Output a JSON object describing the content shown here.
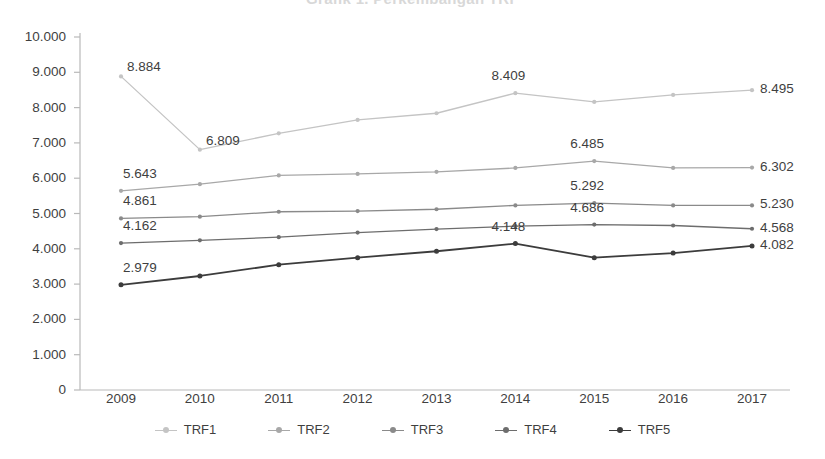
{
  "title_remnant": "Grafik 1. Perkembangan TRF",
  "axis": {
    "y_ticks": [
      "10.000",
      "9.000",
      "8.000",
      "7.000",
      "6.000",
      "5.000",
      "4.000",
      "3.000",
      "2.000",
      "1.000",
      "0"
    ],
    "x_ticks": [
      "2009",
      "2010",
      "2011",
      "2012",
      "2013",
      "2014",
      "2015",
      "2016",
      "2017"
    ]
  },
  "legend": {
    "items": [
      {
        "label": "TRF1",
        "color": "#c4c4c4"
      },
      {
        "label": "TRF2",
        "color": "#a8a8a8"
      },
      {
        "label": "TRF3",
        "color": "#8a8a8a"
      },
      {
        "label": "TRF4",
        "color": "#6d6d6d"
      },
      {
        "label": "TRF5",
        "color": "#3c3c3c"
      }
    ]
  },
  "chart_data": {
    "type": "line",
    "title": "Grafik 1. Perkembangan TRF",
    "xlabel": "",
    "ylabel": "",
    "ylim": [
      0,
      10000
    ],
    "ytick_step": 1000,
    "grid": false,
    "legend_position": "bottom",
    "number_format": "european-thousands-dot",
    "categories": [
      "2009",
      "2010",
      "2011",
      "2012",
      "2013",
      "2014",
      "2015",
      "2016",
      "2017"
    ],
    "series": [
      {
        "name": "TRF1",
        "color": "#c4c4c4",
        "values": [
          8884,
          6809,
          7270,
          7650,
          7840,
          8409,
          8160,
          8360,
          8495
        ],
        "labels": [
          {
            "index": 0,
            "text": "8.884",
            "anchor": "right"
          },
          {
            "index": 1,
            "text": "6.809",
            "anchor": "right"
          },
          {
            "index": 5,
            "text": "8.409",
            "anchor": "center"
          },
          {
            "index": 8,
            "text": "8.495",
            "anchor": "right-outside"
          }
        ]
      },
      {
        "name": "TRF2",
        "color": "#a8a8a8",
        "values": [
          5643,
          5830,
          6080,
          6120,
          6180,
          6290,
          6485,
          6290,
          6302
        ],
        "labels": [
          {
            "index": 0,
            "text": "5.643",
            "anchor": "above"
          },
          {
            "index": 6,
            "text": "6.485",
            "anchor": "center"
          },
          {
            "index": 8,
            "text": "6.302",
            "anchor": "right-outside"
          }
        ]
      },
      {
        "name": "TRF3",
        "color": "#8a8a8a",
        "values": [
          4861,
          4910,
          5050,
          5070,
          5120,
          5230,
          5292,
          5230,
          5230
        ],
        "labels": [
          {
            "index": 0,
            "text": "4.861",
            "anchor": "above"
          },
          {
            "index": 6,
            "text": "5.292",
            "anchor": "center"
          },
          {
            "index": 8,
            "text": "5.230",
            "anchor": "right-outside"
          }
        ]
      },
      {
        "name": "TRF4",
        "color": "#6d6d6d",
        "values": [
          4162,
          4240,
          4330,
          4460,
          4560,
          4640,
          4686,
          4660,
          4568
        ],
        "labels": [
          {
            "index": 0,
            "text": "4.162",
            "anchor": "above"
          },
          {
            "index": 6,
            "text": "4.686",
            "anchor": "center"
          },
          {
            "index": 8,
            "text": "4.568",
            "anchor": "right-outside"
          }
        ]
      },
      {
        "name": "TRF5",
        "color": "#3c3c3c",
        "values": [
          2979,
          3230,
          3550,
          3750,
          3930,
          4148,
          3750,
          3880,
          4082
        ],
        "labels": [
          {
            "index": 0,
            "text": "2.979",
            "anchor": "above"
          },
          {
            "index": 5,
            "text": "4.148",
            "anchor": "center"
          },
          {
            "index": 8,
            "text": "4.082",
            "anchor": "right-outside"
          }
        ]
      }
    ]
  }
}
